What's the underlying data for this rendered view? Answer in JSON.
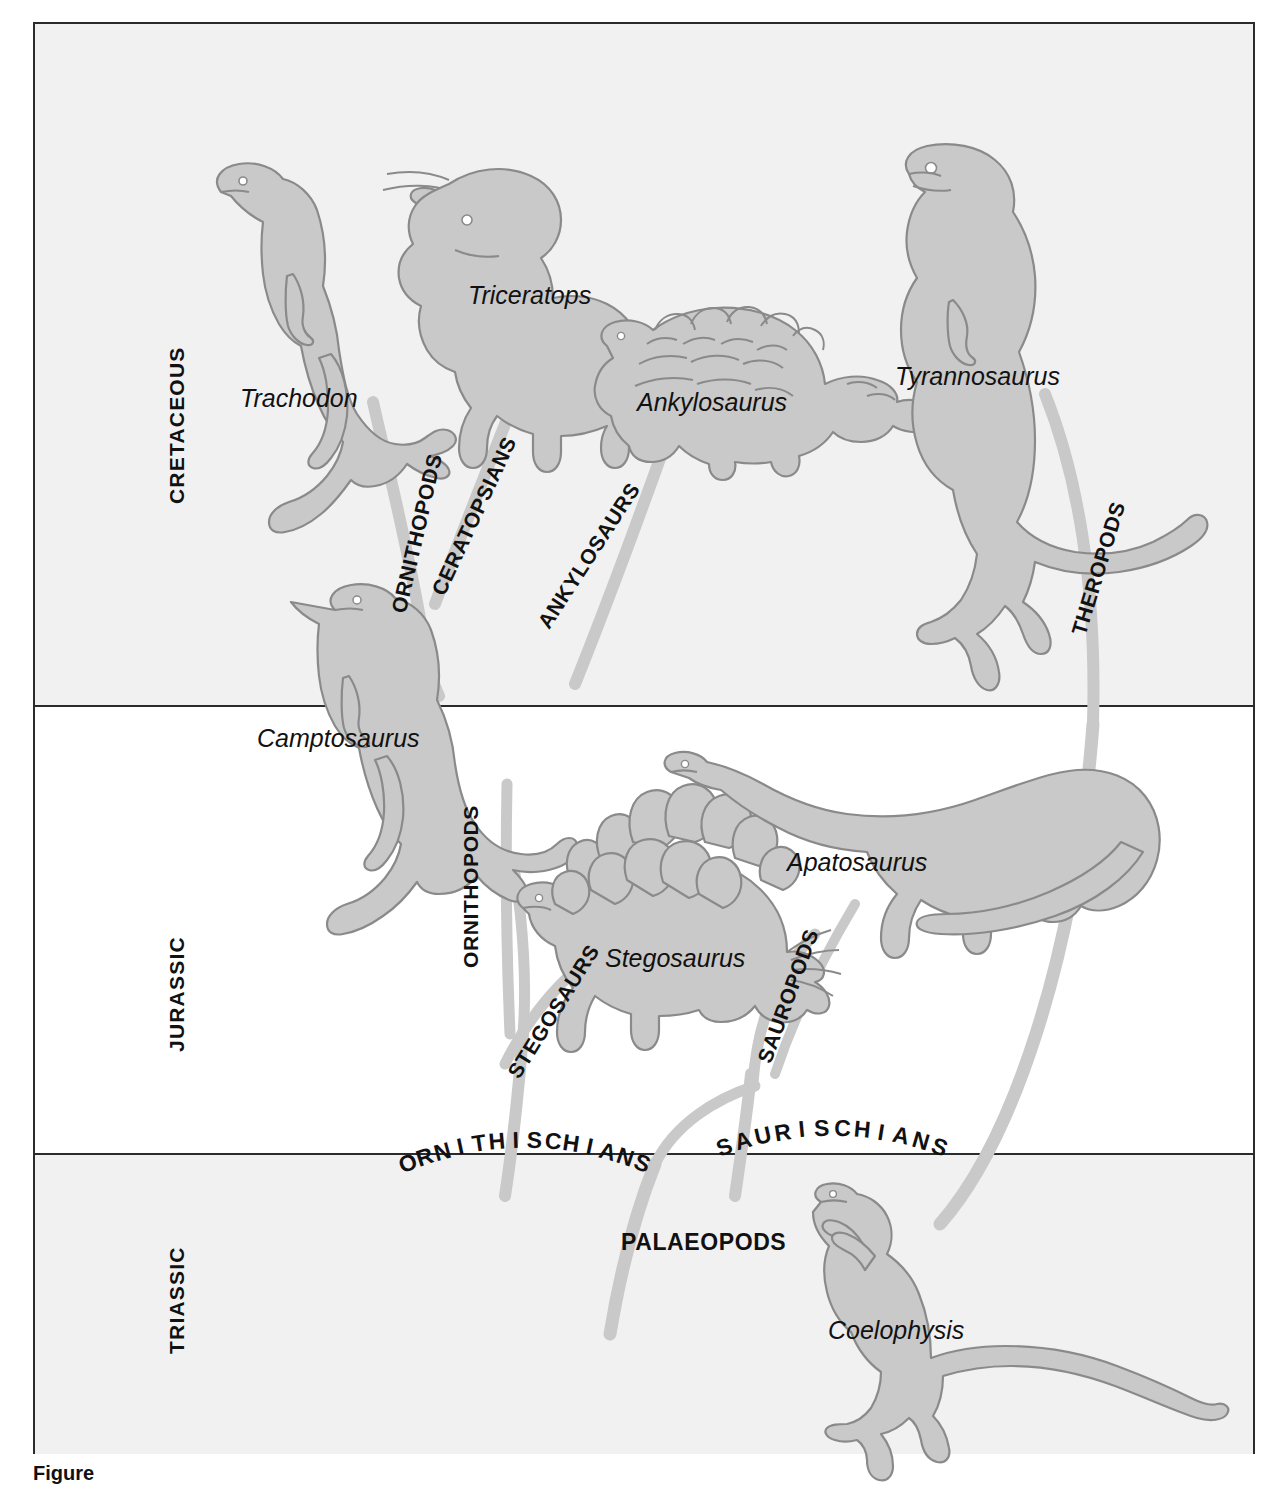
{
  "figure": {
    "domain": "diagram",
    "caption_partial": "Figure"
  },
  "periods": [
    {
      "id": "cretaceous",
      "label": "CRETACEOUS",
      "top": 0,
      "height": 681,
      "shaded": true
    },
    {
      "id": "jurassic",
      "label": "JURASSIC",
      "top": 683,
      "height": 446,
      "shaded": false
    },
    {
      "id": "triassic",
      "label": "TRIASSIC",
      "top": 1131,
      "height": 299,
      "shaded": true
    }
  ],
  "genera": [
    {
      "name": "Trachodon",
      "period": "cretaceous"
    },
    {
      "name": "Triceratops",
      "period": "cretaceous"
    },
    {
      "name": "Ankylosaurus",
      "period": "cretaceous"
    },
    {
      "name": "Tyrannosaurus",
      "period": "cretaceous"
    },
    {
      "name": "Camptosaurus",
      "period": "jurassic"
    },
    {
      "name": "Stegosaurus",
      "period": "jurassic"
    },
    {
      "name": "Apatosaurus",
      "period": "jurassic"
    },
    {
      "name": "Coelophysis",
      "period": "triassic"
    }
  ],
  "clades": [
    {
      "name": "ORNITHOPODS",
      "period": "cretaceous",
      "orientation": "rotated"
    },
    {
      "name": "CERATOPSIANS",
      "period": "cretaceous",
      "orientation": "rotated"
    },
    {
      "name": "ANKYLOSAURS",
      "period": "cretaceous",
      "orientation": "rotated"
    },
    {
      "name": "THEROPODS",
      "period": "cretaceous",
      "orientation": "rotated"
    },
    {
      "name": "ORNITHOPODS",
      "period": "jurassic",
      "orientation": "vertical"
    },
    {
      "name": "STEGOSAURS",
      "period": "jurassic",
      "orientation": "rotated"
    },
    {
      "name": "SAUROPODS",
      "period": "jurassic",
      "orientation": "rotated"
    },
    {
      "name": "ORNITHISCHIANS",
      "period": "jurassic",
      "orientation": "arc"
    },
    {
      "name": "SAURISCHIANS",
      "period": "jurassic",
      "orientation": "arc"
    },
    {
      "name": "PALAEOPODS",
      "period": "triassic",
      "orientation": "horizontal"
    }
  ],
  "colors": {
    "silhouette_fill": "#c9c9c9",
    "silhouette_stroke": "#8a8a8a",
    "branch": "#c9c9c9",
    "frame": "#2b2b2b",
    "band_shaded": "#f1f1f1",
    "band_plain": "#ffffff",
    "text": "#111111"
  },
  "labels": {
    "trachodon": "Trachodon",
    "triceratops": "Triceratops",
    "ankylosaurus": "Ankylosaurus",
    "tyrannosaurus": "Tyrannosaurus",
    "camptosaurus": "Camptosaurus",
    "stegosaurus": "Stegosaurus",
    "apatosaurus": "Apatosaurus",
    "coelophysis": "Coelophysis",
    "ornithopods_cret": "ORNITHOPODS",
    "ceratopsians": "CERATOPSIANS",
    "ankylosaurs": "ANKYLOSAURS",
    "theropods": "THEROPODS",
    "ornithopods_jur": "ORNITHOPODS",
    "stegosaurs": "STEGOSAURS",
    "sauropods": "SAUROPODS",
    "ornithischians": "ORNITHISCHIANS",
    "saurischians": "SAURISCHIANS",
    "palaeopods": "PALAEOPODS",
    "cretaceous": "CRETACEOUS",
    "jurassic": "JURASSIC",
    "triassic": "TRIASSIC"
  }
}
